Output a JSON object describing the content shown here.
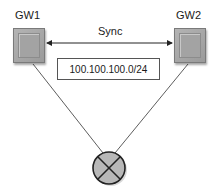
{
  "nodes": {
    "gw1": {
      "label": "GW1"
    },
    "gw2": {
      "label": "GW2"
    },
    "router": {
      "label": ""
    }
  },
  "sync": {
    "label": "Sync"
  },
  "subnet": {
    "label": "100.100.100.0/24"
  },
  "colors": {
    "gateway_fill": "#a3a3a3",
    "router_fill": "#b8b8b8",
    "line": "#333333"
  }
}
